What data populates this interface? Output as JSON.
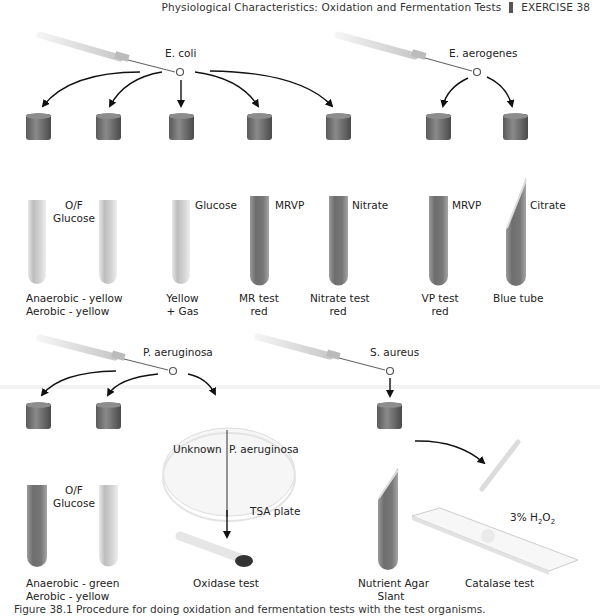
{
  "header": {
    "title": "Physiological Characteristics: Oxidation and Fermentation Tests",
    "exercise": "EXERCISE 38"
  },
  "organisms": {
    "ecoli": "E. coli",
    "eaerogenes": "E. aerogenes",
    "paeruginosa": "P. aeruginosa",
    "saureus": "S. aureus"
  },
  "ecoli_tubes": [
    {
      "medium": "O/F",
      "medium2": "Glucose",
      "result1": "Anaerobic - yellow",
      "result2": "Aerobic - yellow"
    },
    {
      "medium": "",
      "result1": "",
      "result2": ""
    },
    {
      "medium": "Glucose",
      "result1": "Yellow",
      "result2": "+ Gas"
    },
    {
      "medium": "MRVP",
      "result1": "MR test",
      "result2": "red"
    },
    {
      "medium": "Nitrate",
      "result1": "Nitrate test",
      "result2": "red"
    }
  ],
  "eaerogenes_tubes": [
    {
      "medium": "MRVP",
      "result1": "VP test",
      "result2": "red"
    },
    {
      "medium": "Citrate",
      "result1": "Blue tube",
      "result2": ""
    }
  ],
  "paeruginosa_tubes": [
    {
      "medium": "O/F",
      "medium2": "Glucose",
      "result1": "Anaerobic - green",
      "result2": "Aerobic - yellow"
    }
  ],
  "plate": {
    "left": "Unknown",
    "right": "P. aeruginosa",
    "name": "TSA plate",
    "test": "Oxidase test"
  },
  "saureus": {
    "medium1": "Nutrient Agar",
    "medium2": "Slant",
    "reagent": "3% H",
    "reagent_sub1": "2",
    "reagent_mid": "O",
    "reagent_sub2": "2",
    "test": "Catalase test"
  },
  "caption": "Figure 38.1  Procedure for doing oxidation and fermentation tests with the test organisms."
}
